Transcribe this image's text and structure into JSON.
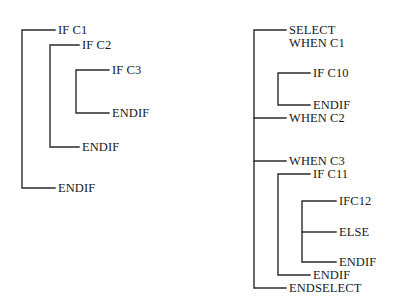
{
  "diagram": {
    "stroke_color": "#2b2b2b",
    "text_color": "#1a1a1a",
    "background_color": "#ffffff",
    "left_structure": {
      "name": "IF-nesting",
      "labels": [
        {
          "id": "l1",
          "text": "IF C1",
          "x": 58,
          "y": 24
        },
        {
          "id": "l2",
          "text": "IF C2",
          "x": 82,
          "y": 39
        },
        {
          "id": "l3",
          "text": "IF C3",
          "x": 112,
          "y": 64
        },
        {
          "id": "l4",
          "text": "ENDIF",
          "x": 112,
          "y": 107
        },
        {
          "id": "l5",
          "text": "ENDIF",
          "x": 82,
          "y": 141
        },
        {
          "id": "l6",
          "text": "ENDIF",
          "x": 58,
          "y": 182
        }
      ],
      "brackets": [
        {
          "id": "b1",
          "level": 1,
          "x": 22,
          "top": 30,
          "bottom": 188,
          "right_top": 55,
          "right_bottom": 55
        },
        {
          "id": "b2",
          "level": 2,
          "x": 50,
          "top": 45,
          "bottom": 147,
          "right_top": 79,
          "right_bottom": 79
        },
        {
          "id": "b3",
          "level": 3,
          "x": 76,
          "top": 70,
          "bottom": 113,
          "right_top": 109,
          "right_bottom": 109
        }
      ]
    },
    "right_structure": {
      "name": "SELECT-WHEN-nesting",
      "labels": [
        {
          "id": "r1",
          "text": "SELECT",
          "x": 289,
          "y": 24
        },
        {
          "id": "r2",
          "text": "WHEN C1",
          "x": 289,
          "y": 37
        },
        {
          "id": "r3",
          "text": "IF C10",
          "x": 313,
          "y": 67
        },
        {
          "id": "r4",
          "text": "ENDIF",
          "x": 313,
          "y": 99
        },
        {
          "id": "r5",
          "text": "WHEN C2",
          "x": 289,
          "y": 112
        },
        {
          "id": "r6",
          "text": "WHEN C3",
          "x": 289,
          "y": 155
        },
        {
          "id": "r7",
          "text": "IF C11",
          "x": 313,
          "y": 168
        },
        {
          "id": "r8",
          "text": "IFC12",
          "x": 339,
          "y": 195
        },
        {
          "id": "r9",
          "text": "ELSE",
          "x": 339,
          "y": 226
        },
        {
          "id": "r10",
          "text": "ENDIF",
          "x": 339,
          "y": 256
        },
        {
          "id": "r11",
          "text": "ENDIF",
          "x": 313,
          "y": 269
        },
        {
          "id": "r12",
          "text": "ENDSELECT",
          "x": 289,
          "y": 282
        }
      ],
      "brackets": [
        {
          "id": "rb1",
          "level": 1,
          "x": 254,
          "top": 30,
          "bottom": 288,
          "right_top": 286,
          "right_bottom": 286
        },
        {
          "id": "rb2",
          "level": 2,
          "x": 278,
          "top": 73,
          "bottom": 105,
          "right_top": 310,
          "right_bottom": 310
        },
        {
          "id": "rb3",
          "level": 2,
          "x": 278,
          "top": 174,
          "bottom": 275,
          "right_top": 310,
          "right_bottom": 310
        },
        {
          "id": "rb4",
          "level": 3,
          "x": 302,
          "top": 201,
          "bottom": 262,
          "right_top": 336,
          "right_bottom": 336
        }
      ],
      "tick_branches": [
        {
          "id": "t1",
          "from_x": 254,
          "to_x": 286,
          "y": 118,
          "label_ref": "r5"
        },
        {
          "id": "t2",
          "from_x": 254,
          "to_x": 286,
          "y": 161,
          "label_ref": "r6"
        },
        {
          "id": "t3",
          "from_x": 302,
          "to_x": 336,
          "y": 232,
          "label_ref": "r9"
        }
      ]
    }
  }
}
